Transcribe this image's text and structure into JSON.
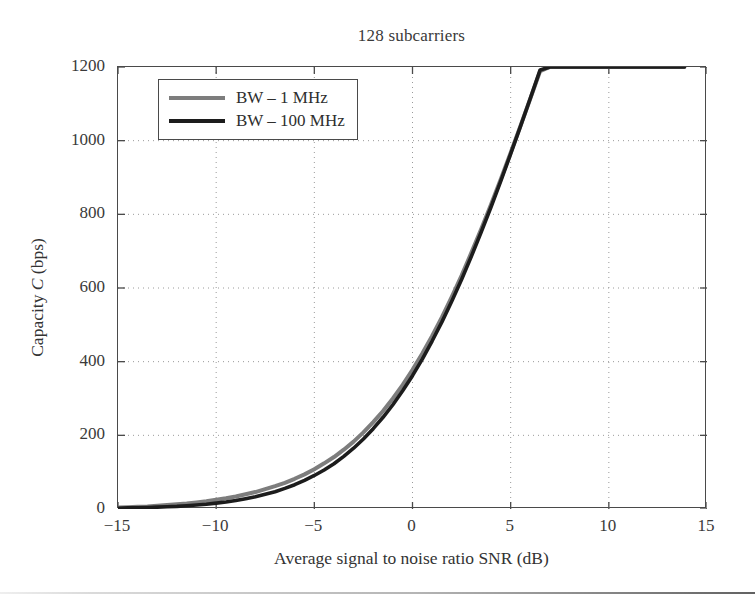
{
  "chart_data": {
    "type": "line",
    "title": "128 subcarriers",
    "xlabel": "Average signal to noise ratio  SNR  (dB)",
    "ylabel_prefix": "Capacity ",
    "ylabel_var": "C",
    "ylabel_suffix": " (bps)",
    "xlim": [
      -15,
      15
    ],
    "ylim": [
      0,
      1200
    ],
    "xticks": [
      -15,
      -10,
      -5,
      0,
      5,
      10,
      15
    ],
    "yticks": [
      0,
      200,
      400,
      600,
      800,
      1000,
      1200
    ],
    "xtick_labels": [
      "−15",
      "−10",
      "−5",
      "0",
      "5",
      "10",
      "15"
    ],
    "ytick_labels": [
      "0",
      "200",
      "400",
      "600",
      "800",
      "1000",
      "1200"
    ],
    "grid": true,
    "grid_style": "dotted",
    "legend_position": "upper left",
    "series": [
      {
        "name": "BW – 1 MHz",
        "color": "#7d7d7d",
        "width": 4.0,
        "x": [
          -15,
          -14.5,
          -14,
          -13.5,
          -13,
          -12.5,
          -12,
          -11.5,
          -11,
          -10.5,
          -10,
          -9.5,
          -9,
          -8.5,
          -8,
          -7.5,
          -7,
          -6.5,
          -6,
          -5.5,
          -5,
          -4.5,
          -4,
          -3.5,
          -3,
          -2.5,
          -2,
          -1.5,
          -1,
          -0.5,
          0,
          0.5,
          1,
          1.5,
          2,
          2.5,
          3,
          3.5,
          4,
          4.5,
          5,
          5.5,
          6,
          6.5,
          7,
          7.5,
          8,
          8.5,
          9,
          9.5,
          10,
          10.5,
          11,
          11.5,
          12,
          12.5,
          13,
          13.5,
          13.85
        ],
        "y": [
          4,
          5,
          6,
          7,
          9,
          11,
          13,
          15,
          18,
          21,
          25,
          29,
          34,
          40,
          46,
          54,
          62,
          71,
          82,
          94,
          108,
          124,
          141,
          161,
          183,
          208,
          236,
          266,
          300,
          337,
          378,
          422,
          470,
          521,
          576,
          634,
          696,
          760,
          827,
          896,
          967,
          1040,
          1114,
          1189,
          1200,
          1200,
          1200,
          1200,
          1200,
          1200,
          1200,
          1200,
          1200,
          1200,
          1200,
          1200,
          1200,
          1200,
          1200
        ]
      },
      {
        "name": "BW – 100 MHz",
        "color": "#1c1c1c",
        "width": 3.6,
        "x": [
          -15,
          -14.5,
          -14,
          -13.5,
          -13,
          -12.5,
          -12,
          -11.5,
          -11,
          -10.5,
          -10,
          -9.5,
          -9,
          -8.5,
          -8,
          -7.5,
          -7,
          -6.5,
          -6,
          -5.5,
          -5,
          -4.5,
          -4,
          -3.5,
          -3,
          -2.5,
          -2,
          -1.5,
          -1,
          -0.5,
          0,
          0.5,
          1,
          1.5,
          2,
          2.5,
          3,
          3.5,
          4,
          4.5,
          5,
          5.5,
          6,
          6.5,
          7,
          7.5,
          8,
          8.5,
          9,
          9.5,
          10,
          10.5,
          11,
          11.5,
          12,
          12.5,
          13,
          13.5,
          13.85
        ],
        "y": [
          2,
          3,
          3,
          4,
          5,
          6,
          7,
          9,
          11,
          13,
          16,
          19,
          23,
          28,
          33,
          40,
          47,
          56,
          66,
          78,
          91,
          106,
          123,
          143,
          165,
          190,
          218,
          249,
          283,
          321,
          362,
          407,
          456,
          508,
          564,
          623,
          686,
          752,
          820,
          891,
          964,
          1039,
          1115,
          1192,
          1200,
          1200,
          1200,
          1200,
          1200,
          1200,
          1200,
          1200,
          1200,
          1200,
          1200,
          1200,
          1200,
          1200,
          1200
        ]
      }
    ]
  },
  "legend": {
    "items": [
      {
        "label": "BW – 1 MHz",
        "color": "#7d7d7d"
      },
      {
        "label": "BW – 100 MHz",
        "color": "#1c1c1c"
      }
    ]
  },
  "colors": {
    "axis": "#4a4a4a",
    "grid": "#9a9a9a",
    "text": "#333333",
    "background": "#ffffff"
  }
}
